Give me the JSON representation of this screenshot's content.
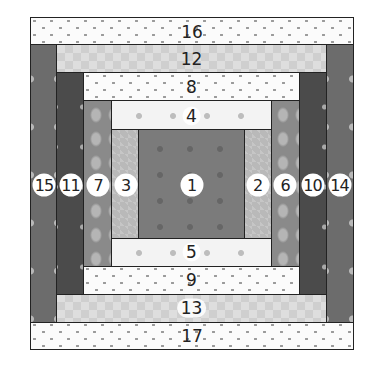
{
  "diagram": {
    "type": "log-cabin",
    "colors": {
      "outline": "#222222",
      "center_block": "#7b7b7b",
      "light_gray_strip": "#b9b9b9",
      "mid_gray_strip": "#8a8a8a",
      "dark_strip": "#4b4b4b",
      "med_dark_strip": "#6c6c6c",
      "near_white_flower_strip": "#f3f3f3",
      "white_dot_strip": "#fbfbfb",
      "diamond_strip": "#dedede",
      "label_circle": "#ffffff"
    },
    "pieces": [
      {
        "label": "1",
        "role": "center",
        "pattern": "dark-gray floral",
        "x": 139,
        "y": 130,
        "w": 105,
        "h": 108
      },
      {
        "label": "2",
        "role": "right",
        "pattern": "light gray",
        "x": 244,
        "y": 130,
        "w": 27,
        "h": 108
      },
      {
        "label": "3",
        "role": "left",
        "pattern": "light gray",
        "x": 112,
        "y": 130,
        "w": 27,
        "h": 108
      },
      {
        "label": "4",
        "role": "top",
        "pattern": "white floral",
        "x": 112,
        "y": 101,
        "w": 159,
        "h": 29
      },
      {
        "label": "5",
        "role": "bottom",
        "pattern": "white floral",
        "x": 112,
        "y": 238,
        "w": 159,
        "h": 28
      },
      {
        "label": "6",
        "role": "right",
        "pattern": "mid gray blossom",
        "x": 271,
        "y": 101,
        "w": 28,
        "h": 165
      },
      {
        "label": "7",
        "role": "left",
        "pattern": "mid gray blossom",
        "x": 84,
        "y": 101,
        "w": 28,
        "h": 165
      },
      {
        "label": "8",
        "role": "top",
        "pattern": "white dots",
        "x": 84,
        "y": 73,
        "w": 215,
        "h": 28
      },
      {
        "label": "9",
        "role": "bottom",
        "pattern": "white dots",
        "x": 84,
        "y": 266,
        "w": 215,
        "h": 28
      },
      {
        "label": "10",
        "role": "right",
        "pattern": "dark floral",
        "x": 299,
        "y": 73,
        "w": 27,
        "h": 221
      },
      {
        "label": "11",
        "role": "left",
        "pattern": "dark floral",
        "x": 57,
        "y": 73,
        "w": 27,
        "h": 221
      },
      {
        "label": "12",
        "role": "top",
        "pattern": "light diamond",
        "x": 57,
        "y": 45,
        "w": 269,
        "h": 28
      },
      {
        "label": "13",
        "role": "bottom",
        "pattern": "light diamond",
        "x": 57,
        "y": 294,
        "w": 269,
        "h": 28
      },
      {
        "label": "14",
        "role": "right",
        "pattern": "medium-dark floral",
        "x": 326,
        "y": 45,
        "w": 28,
        "h": 277
      },
      {
        "label": "15",
        "role": "left",
        "pattern": "medium-dark floral",
        "x": 30,
        "y": 45,
        "w": 27,
        "h": 277
      },
      {
        "label": "16",
        "role": "top",
        "pattern": "white dots",
        "x": 30,
        "y": 17,
        "w": 324,
        "h": 28
      },
      {
        "label": "17",
        "role": "bottom",
        "pattern": "white dots",
        "x": 30,
        "y": 322,
        "w": 324,
        "h": 28
      }
    ],
    "side_label_y": 184
  }
}
